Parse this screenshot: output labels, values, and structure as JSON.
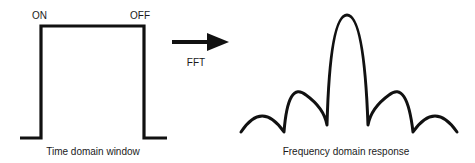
{
  "time_domain": {
    "on_label": "ON",
    "off_label": "OFF",
    "caption": "Time domain window"
  },
  "transform": {
    "label": "FFT",
    "arrow_icon": "right-arrow-icon"
  },
  "frequency_domain": {
    "caption": "Frequency domain response"
  },
  "colors": {
    "stroke": "#111111",
    "text": "#1a1a1a",
    "background": "#ffffff"
  }
}
